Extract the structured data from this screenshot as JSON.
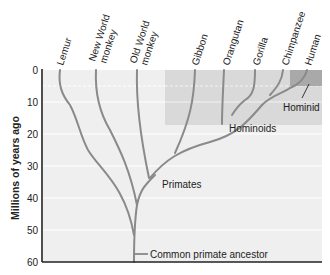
{
  "diagram": {
    "y_axis": {
      "title": "Millions of years ago",
      "ticks": [
        "0",
        "10",
        "20",
        "30",
        "40",
        "50",
        "60"
      ],
      "range": [
        0,
        60
      ]
    },
    "species": [
      {
        "name": "Lemur"
      },
      {
        "name": "New World monkey",
        "line1": "New World",
        "line2": "monkey"
      },
      {
        "name": "Old World monkey",
        "line1": "Old World",
        "line2": "monkey"
      },
      {
        "name": "Gibbon"
      },
      {
        "name": "Orangutan"
      },
      {
        "name": "Gorilla"
      },
      {
        "name": "Chimpanzee"
      },
      {
        "name": "Human"
      }
    ],
    "groups": {
      "hominid": "Hominid",
      "hominoids": "Hominoids",
      "primates": "Primates"
    },
    "ancestor_label": "Common primate ancestor",
    "colors": {
      "background": "#efefef",
      "hominoid_band": "#d9d9d9",
      "hominid_band": "#a9a9a9",
      "branch": "#8a8a8a",
      "axis": "#222222"
    }
  }
}
